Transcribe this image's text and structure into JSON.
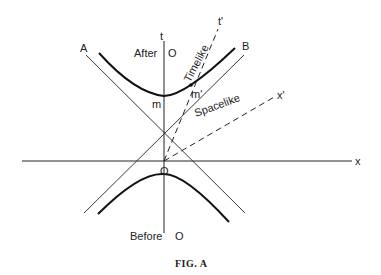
{
  "figure": {
    "caption": "FIG. A",
    "axes": {
      "time_axis": "t",
      "space_axis": "x",
      "moving_time_axis": "t'",
      "moving_space_axis": "x'"
    },
    "light_lines": {
      "left": "A",
      "right": "B"
    },
    "origin": "O",
    "labels": {
      "after": "After",
      "after_o": "O",
      "before": "Before",
      "before_o": "O",
      "m": "m",
      "m_prime": "m'",
      "timelike": "Timelike",
      "spacelike": "Spacelike"
    },
    "colors": {
      "ink": "#222222",
      "background": "#ffffff"
    }
  }
}
